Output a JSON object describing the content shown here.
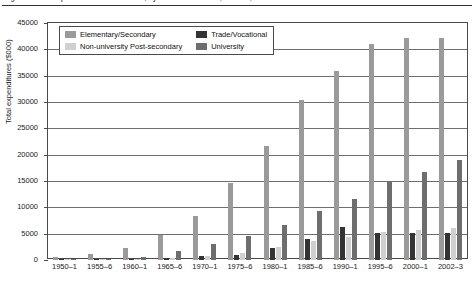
{
  "caption": {
    "text": "Figure 1  Total expenditures on education, by level of education, Canada, 1950–1 to 2002–3"
  },
  "chart_data": {
    "type": "bar",
    "title": "",
    "subtitle": "",
    "xlabel": "",
    "ylabel": "Total expenditures ($000)",
    "ylim": [
      0,
      45000
    ],
    "ytick_values": [
      0,
      5000,
      10000,
      15000,
      20000,
      25000,
      30000,
      35000,
      40000,
      45000
    ],
    "ytick_labels": [
      "0",
      "5000",
      "10000",
      "15000",
      "20000",
      "25000",
      "30000",
      "35000",
      "40000",
      "45000"
    ],
    "grid": true,
    "legend_position": "top-left-inside",
    "categories": [
      "1950–1",
      "1955–6",
      "1960–1",
      "1965–6",
      "1970–1",
      "1975–6",
      "1980–1",
      "1985–6",
      "1990–1",
      "1995–6",
      "2000–1",
      "2002–3"
    ],
    "series": [
      {
        "name": "Elementary/Secondary",
        "color": "#9a9a9a",
        "values": [
          600,
          1100,
          2300,
          4700,
          8300,
          14700,
          21700,
          30400,
          35900,
          41100,
          42200,
          42200
        ]
      },
      {
        "name": "Trade/Vocational",
        "color": "#333333",
        "values": [
          30,
          60,
          180,
          430,
          720,
          1000,
          2300,
          3900,
          6200,
          5100,
          5100,
          5200
        ]
      },
      {
        "name": "Non-university Post-secondary",
        "color": "#d0d0d0",
        "values": [
          20,
          40,
          120,
          330,
          700,
          1350,
          2400,
          3600,
          4400,
          5300,
          5700,
          6000
        ]
      },
      {
        "name": "University",
        "color": "#6e6e6e",
        "values": [
          110,
          200,
          560,
          1700,
          3000,
          4500,
          6700,
          9400,
          11600,
          14800,
          16800,
          19000
        ]
      }
    ]
  },
  "legend": {
    "items": [
      {
        "label": "Elementary/Secondary",
        "swatch": "s0"
      },
      {
        "label": "Trade/Vocational",
        "swatch": "s1"
      },
      {
        "label": "Non-university Post-secondary",
        "swatch": "s2"
      },
      {
        "label": "University",
        "swatch": "s3"
      }
    ]
  }
}
